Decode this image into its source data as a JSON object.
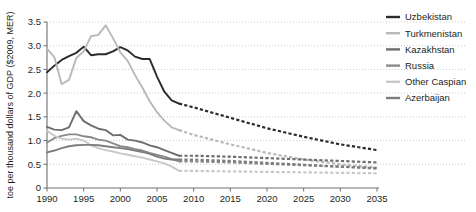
{
  "chart_data": {
    "type": "line",
    "title": "",
    "subtitle": "",
    "xlabel": "",
    "ylabel": "toe per thousand dollars of GDP ($2009, MER)",
    "xlim": [
      1990,
      2035
    ],
    "ylim": [
      0,
      3.5
    ],
    "grid": true,
    "grid_axis": "y",
    "grid_style": "dotted",
    "legend_position": "right",
    "x_ticks": [
      "1990",
      "1995",
      "2000",
      "2005",
      "2010",
      "2015",
      "2020",
      "2025",
      "2030",
      "2035"
    ],
    "x_tick_values": [
      1990,
      1995,
      2000,
      2005,
      2010,
      2015,
      2020,
      2025,
      2030,
      2035
    ],
    "y_ticks": [
      "0",
      "0.5",
      "1.0",
      "1.5",
      "2.0",
      "2.5",
      "3.0",
      "3.5"
    ],
    "y_tick_values": [
      0,
      0.5,
      1.0,
      1.5,
      2.0,
      2.5,
      3.0,
      3.5
    ],
    "history_end_year": 2008,
    "projection_note": "dashed segments are projections",
    "series": [
      {
        "name": "Uzbekistan",
        "color": "#2b2b2b",
        "x": [
          1990,
          1991,
          1992,
          1993,
          1994,
          1995,
          1996,
          1997,
          1998,
          1999,
          2000,
          2001,
          2002,
          2003,
          2004,
          2005,
          2006,
          2007,
          2008,
          2010,
          2015,
          2020,
          2025,
          2030,
          2035
        ],
        "values": [
          2.44,
          2.58,
          2.7,
          2.78,
          2.85,
          2.98,
          2.8,
          2.82,
          2.82,
          2.88,
          2.97,
          2.9,
          2.77,
          2.72,
          2.72,
          2.35,
          2.03,
          1.85,
          1.78,
          1.7,
          1.48,
          1.26,
          1.08,
          0.92,
          0.8
        ],
        "history_values": [
          2.44,
          2.58,
          2.7,
          2.78,
          2.85,
          2.98,
          2.8,
          2.82,
          2.82,
          2.88,
          2.97,
          2.9,
          2.77,
          2.72,
          2.72,
          2.35,
          2.03,
          1.85,
          1.78
        ],
        "projection_values": [
          1.78,
          1.7,
          1.48,
          1.26,
          1.08,
          0.92,
          0.8
        ]
      },
      {
        "name": "Turkmenistan",
        "color": "#b9b9b9",
        "x": [
          1990,
          1991,
          1992,
          1993,
          1994,
          1995,
          1996,
          1997,
          1998,
          1999,
          2000,
          2001,
          2002,
          2003,
          2004,
          2005,
          2006,
          2007,
          2008,
          2010,
          2015,
          2020,
          2025,
          2030,
          2035
        ],
        "values": [
          2.94,
          2.76,
          2.19,
          2.28,
          2.74,
          2.88,
          3.2,
          3.23,
          3.43,
          3.16,
          2.86,
          2.68,
          2.38,
          2.12,
          1.83,
          1.6,
          1.42,
          1.28,
          1.22,
          1.12,
          0.92,
          0.74,
          0.6,
          0.5,
          0.43
        ],
        "history_values": [
          2.94,
          2.76,
          2.19,
          2.28,
          2.74,
          2.88,
          3.2,
          3.23,
          3.43,
          3.16,
          2.86,
          2.68,
          2.38,
          2.12,
          1.83,
          1.6,
          1.42,
          1.28,
          1.22
        ],
        "projection_values": [
          1.22,
          1.12,
          0.92,
          0.74,
          0.6,
          0.5,
          0.43
        ]
      },
      {
        "name": "Kazakhstan",
        "color": "#6e6e6e",
        "x": [
          1990,
          1991,
          1992,
          1993,
          1994,
          1995,
          1996,
          1997,
          1998,
          1999,
          2000,
          2001,
          2002,
          2003,
          2004,
          2005,
          2006,
          2007,
          2008,
          2010,
          2015,
          2020,
          2025,
          2030,
          2035
        ],
        "values": [
          1.29,
          1.23,
          1.22,
          1.28,
          1.62,
          1.41,
          1.32,
          1.25,
          1.22,
          1.11,
          1.12,
          1.02,
          1.0,
          0.96,
          0.9,
          0.86,
          0.8,
          0.74,
          0.68,
          0.68,
          0.66,
          0.63,
          0.6,
          0.57,
          0.54
        ],
        "history_values": [
          1.29,
          1.23,
          1.22,
          1.28,
          1.62,
          1.41,
          1.32,
          1.25,
          1.22,
          1.11,
          1.12,
          1.02,
          1.0,
          0.96,
          0.9,
          0.86,
          0.8,
          0.74,
          0.68
        ],
        "projection_values": [
          0.68,
          0.68,
          0.66,
          0.63,
          0.6,
          0.57,
          0.54
        ]
      },
      {
        "name": "Russia",
        "color": "#8a8a8a",
        "x": [
          1990,
          1991,
          1992,
          1993,
          1994,
          1995,
          1996,
          1997,
          1998,
          1999,
          2000,
          2001,
          2002,
          2003,
          2004,
          2005,
          2006,
          2007,
          2008,
          2010,
          2015,
          2020,
          2025,
          2030,
          2035
        ],
        "values": [
          0.96,
          1.05,
          1.1,
          1.13,
          1.13,
          1.09,
          1.07,
          1.02,
          1.0,
          0.94,
          0.88,
          0.86,
          0.82,
          0.79,
          0.74,
          0.7,
          0.66,
          0.61,
          0.56,
          0.56,
          0.54,
          0.51,
          0.48,
          0.45,
          0.42
        ],
        "history_values": [
          0.96,
          1.05,
          1.1,
          1.13,
          1.13,
          1.09,
          1.07,
          1.02,
          1.0,
          0.94,
          0.88,
          0.86,
          0.82,
          0.79,
          0.74,
          0.7,
          0.66,
          0.61,
          0.56
        ],
        "projection_values": [
          0.56,
          0.56,
          0.54,
          0.51,
          0.48,
          0.45,
          0.42
        ]
      },
      {
        "name": "Other Caspian",
        "color": "#c8c8c8",
        "x": [
          1990,
          1991,
          1992,
          1993,
          1994,
          1995,
          1996,
          1997,
          1998,
          1999,
          2000,
          2001,
          2002,
          2003,
          2004,
          2005,
          2006,
          2007,
          2008,
          2010,
          2015,
          2020,
          2025,
          2030,
          2035
        ],
        "values": [
          1.21,
          1.1,
          1.04,
          1.02,
          1.04,
          1.0,
          0.9,
          0.84,
          0.8,
          0.77,
          0.73,
          0.7,
          0.67,
          0.64,
          0.6,
          0.56,
          0.52,
          0.45,
          0.36,
          0.36,
          0.35,
          0.34,
          0.33,
          0.32,
          0.31
        ],
        "history_values": [
          1.21,
          1.1,
          1.04,
          1.02,
          1.04,
          1.0,
          0.9,
          0.84,
          0.8,
          0.77,
          0.73,
          0.7,
          0.67,
          0.64,
          0.6,
          0.56,
          0.52,
          0.45,
          0.36
        ],
        "projection_values": [
          0.36,
          0.36,
          0.35,
          0.34,
          0.33,
          0.32,
          0.31
        ]
      },
      {
        "name": "Azerbaijan",
        "color": "#7d7d7d",
        "x": [
          1990,
          1991,
          1992,
          1993,
          1994,
          1995,
          1996,
          1997,
          1998,
          1999,
          2000,
          2001,
          2002,
          2003,
          2004,
          2005,
          2006,
          2007,
          2008,
          2010,
          2015,
          2020,
          2025,
          2030,
          2035
        ],
        "values": [
          0.75,
          0.79,
          0.84,
          0.88,
          0.9,
          0.91,
          0.91,
          0.9,
          0.88,
          0.86,
          0.84,
          0.82,
          0.79,
          0.76,
          0.72,
          0.66,
          0.62,
          0.6,
          0.6,
          0.6,
          0.57,
          0.53,
          0.49,
          0.45,
          0.41
        ],
        "history_values": [
          0.75,
          0.79,
          0.84,
          0.88,
          0.9,
          0.91,
          0.91,
          0.9,
          0.88,
          0.86,
          0.84,
          0.82,
          0.79,
          0.76,
          0.72,
          0.66,
          0.62,
          0.6,
          0.6
        ],
        "projection_values": [
          0.6,
          0.6,
          0.57,
          0.53,
          0.49,
          0.45,
          0.41
        ]
      }
    ]
  },
  "legend": {
    "items": [
      {
        "label": "Uzbekistan",
        "color": "#2b2b2b"
      },
      {
        "label": "Turkmenistan",
        "color": "#b9b9b9"
      },
      {
        "label": "Kazakhstan",
        "color": "#6e6e6e"
      },
      {
        "label": "Russia",
        "color": "#8a8a8a"
      },
      {
        "label": "Other Caspian",
        "color": "#c8c8c8"
      },
      {
        "label": "Azerbaijan",
        "color": "#7d7d7d"
      }
    ]
  },
  "axes": {
    "y_title": "toe per thousand dollars of GDP ($2009, MER)"
  },
  "colors": {
    "text": "#231f20",
    "axis": "#6d6e71",
    "grid": "#bcbec0",
    "background": "#ffffff"
  }
}
